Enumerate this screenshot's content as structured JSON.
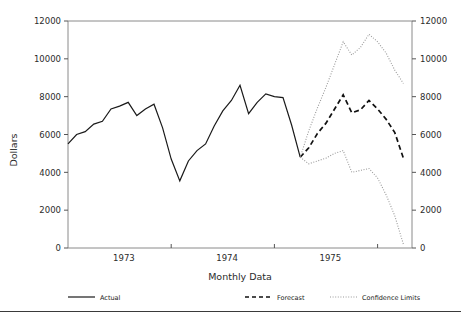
{
  "chart_data": {
    "type": "line",
    "title": "",
    "xlabel": "Monthly Data",
    "ylabel": "Dollars",
    "ylim": [
      0,
      12000
    ],
    "xlim": [
      0,
      40
    ],
    "grid": false,
    "legend_position": "bottom",
    "y_ticks": [
      0,
      2000,
      4000,
      6000,
      8000,
      10000,
      12000
    ],
    "y_tick_labels": [
      "0",
      "2000",
      "4000",
      "6000",
      "8000",
      "10000",
      "12000"
    ],
    "y_ticks_right": [
      0,
      2000,
      4000,
      6000,
      8000,
      10000,
      12000
    ],
    "y_tick_labels_right": [
      "0",
      "2000",
      "4000",
      "6000",
      "8000",
      "10000",
      "12000"
    ],
    "x_ticks": [
      12,
      24,
      36
    ],
    "x_tick_labels": [
      "1973",
      "1974",
      "1975"
    ],
    "x_tick_label_positions": [
      6.5,
      18.5,
      30.5
    ],
    "series": [
      {
        "name": "Actual",
        "style": "solid",
        "color": "#1a1a1a",
        "x": [
          0,
          1,
          2,
          3,
          4,
          5,
          6,
          7,
          8,
          9,
          10,
          11,
          12,
          13,
          14,
          15,
          16,
          17,
          18,
          19,
          20,
          21,
          22,
          23,
          24,
          25,
          26,
          27
        ],
        "values": [
          5500,
          6000,
          6150,
          6550,
          6700,
          7350,
          7500,
          7700,
          7000,
          7350,
          7600,
          6350,
          4700,
          3550,
          4600,
          5150,
          5500,
          6450,
          7250,
          7800,
          8600,
          7100,
          7700,
          8150,
          8000,
          7950,
          6500,
          4800
        ]
      },
      {
        "name": "Forecast",
        "style": "dashed",
        "color": "#111111",
        "x": [
          27,
          28,
          29,
          30,
          31,
          32,
          33,
          34,
          35,
          36,
          37,
          38,
          39
        ],
        "values": [
          4800,
          5300,
          6050,
          6600,
          7350,
          8100,
          7150,
          7300,
          7800,
          7350,
          6800,
          6100,
          4750
        ]
      },
      {
        "name": "Confidence Limits",
        "style": "dotted",
        "color": "#9a9a9a",
        "bound": "upper",
        "x": [
          27,
          28,
          29,
          30,
          31,
          32,
          33,
          34,
          35,
          36,
          37,
          38,
          39
        ],
        "values": [
          4800,
          6200,
          7400,
          8500,
          9700,
          10900,
          10200,
          10600,
          11300,
          10900,
          10300,
          9400,
          8700
        ]
      },
      {
        "name": "Confidence Limits",
        "style": "dotted",
        "color": "#9a9a9a",
        "bound": "lower",
        "x": [
          27,
          28,
          29,
          30,
          31,
          32,
          33,
          34,
          35,
          36,
          37,
          38,
          39
        ],
        "values": [
          4800,
          4450,
          4600,
          4750,
          5000,
          5150,
          4000,
          4100,
          4200,
          3700,
          2800,
          1700,
          200
        ]
      }
    ],
    "legend": [
      {
        "label": "Actual",
        "style": "solid"
      },
      {
        "label": "Forecast",
        "style": "dashed"
      },
      {
        "label": "Confidence Limits",
        "style": "dotted"
      }
    ]
  }
}
